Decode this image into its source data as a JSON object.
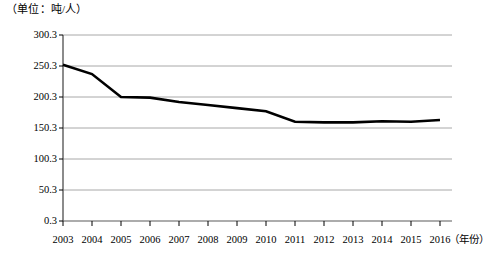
{
  "chart_data": {
    "type": "line",
    "title": "",
    "unit_label": "（单位：吨/人）",
    "xlabel": "（年份）",
    "ylabel": "",
    "categories": [
      2003,
      2004,
      2005,
      2006,
      2007,
      2008,
      2009,
      2010,
      2011,
      2012,
      2013,
      2014,
      2015,
      2016
    ],
    "xtick_labels": [
      "2003",
      "2004",
      "2005",
      "2006",
      "2007",
      "2008",
      "2009",
      "2010",
      "2011",
      "2012",
      "2013",
      "2014",
      "2015",
      "2016"
    ],
    "values": [
      252.3,
      237.3,
      200.3,
      199.3,
      192.3,
      187.3,
      182.3,
      177.3,
      160.3,
      159.3,
      159.3,
      161.3,
      160.3,
      163.3
    ],
    "ytick_labels": [
      "0.3",
      "50.3",
      "100.3",
      "150.3",
      "200.3",
      "250.3",
      "300.3"
    ],
    "ytick_values": [
      0.3,
      50.3,
      100.3,
      150.3,
      200.3,
      250.3,
      300.3
    ],
    "ylim": [
      0.3,
      300.3
    ],
    "grid": true,
    "legend": "none",
    "series_color": "#000000",
    "grid_color": "#a8a8a8",
    "axis_color": "#7a7a7a"
  }
}
